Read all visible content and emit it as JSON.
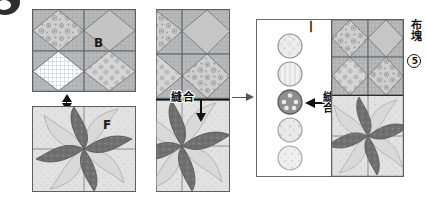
{
  "figure": {
    "kind": "quilt-assembly-instruction-diagram",
    "step_marker": "circled-step-bullet"
  },
  "panels": {
    "left": {
      "name": "panel-left",
      "top_block": {
        "label": "B",
        "name": "block-b-kaleidoscope"
      },
      "bottom_block": {
        "label": "F",
        "name": "block-f-pinwheel"
      },
      "join_arrow": "double-headed-vertical-arrow"
    },
    "middle": {
      "name": "panel-middle",
      "seam_label": "縫合",
      "seam_arrow": "down-arrow",
      "top_block": {
        "label": "",
        "name": "block-b-joined"
      },
      "bottom_block": {
        "label": "",
        "name": "block-f-joined"
      }
    },
    "right": {
      "name": "panel-right",
      "strip_label": "丨",
      "seam_label": "縫合",
      "seam_arrow": "left-arrow",
      "fabric_piece_label": "布塊",
      "fabric_piece_number": "5",
      "circles": [
        {
          "name": "yoyo-circle-1",
          "style": "light-print"
        },
        {
          "name": "yoyo-circle-2",
          "style": "stripe-print"
        },
        {
          "name": "yoyo-circle-3",
          "style": "dark-dot-print",
          "highlighted": true
        },
        {
          "name": "yoyo-circle-4",
          "style": "light-dot-print"
        },
        {
          "name": "yoyo-circle-5",
          "style": "pale-print"
        }
      ]
    },
    "transition_arrow": "right-arrow"
  },
  "colors": {
    "ink": "#141414",
    "dark_fabric": "#6f6f6f",
    "mid_fabric": "#a8a8a8",
    "light_fabric": "#d8d8d8",
    "grid_line": "#b9c3cc",
    "panel_border": "#6a6a6a",
    "highlight_circle": "#8d8d8d"
  }
}
